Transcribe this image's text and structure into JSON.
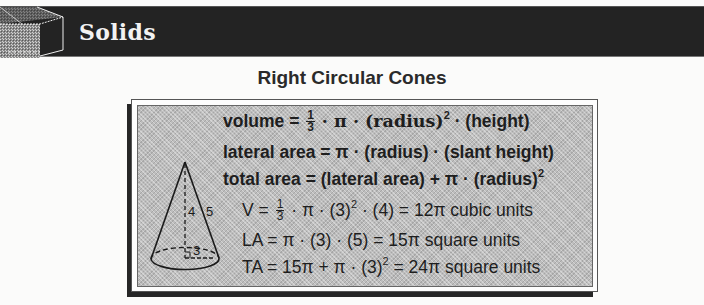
{
  "header": {
    "title": "Solids",
    "icon": "cube-icon",
    "band_color": "#232323"
  },
  "section": {
    "title": "Right Circular Cones"
  },
  "diagram": {
    "shape": "right-circular-cone",
    "labels": {
      "height": "4",
      "slant_height": "5",
      "radius": "3"
    }
  },
  "formulas": {
    "general": [
      {
        "id": "volume",
        "lhs": "volume =",
        "frac_num": "1",
        "frac_den": "3",
        "rhs_a": "· π · (radius)",
        "sup": "2",
        "rhs_b": " · (height)"
      },
      {
        "id": "lateral_area",
        "text": "lateral area = π · (radius) · (slant height)"
      },
      {
        "id": "total_area",
        "text": "total area = (lateral area) + π · (radius)",
        "sup": "2"
      }
    ],
    "example": [
      {
        "id": "V",
        "lhs": "V =",
        "frac_num": "1",
        "frac_den": "3",
        "rhs_a": "· π · (3)",
        "sup": "2",
        "rhs_b": " · (4) = 12π cubic units"
      },
      {
        "id": "LA",
        "text": "LA = π · (3) · (5) = 15π square units"
      },
      {
        "id": "TA",
        "text_a": "TA = 15π + π · (3)",
        "sup": "2",
        "text_b": " = 24π square units"
      }
    ]
  }
}
